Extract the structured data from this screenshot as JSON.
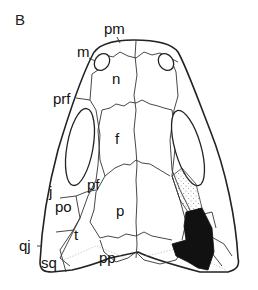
{
  "figure": {
    "panel_label": "B",
    "labels": {
      "pm": "pm",
      "m": "m",
      "n": "n",
      "prf": "prf",
      "f": "f",
      "pf": "pf",
      "j": "j",
      "po": "po",
      "p": "p",
      "qj": "qj",
      "t": "t",
      "sq": "sq",
      "pp": "pp"
    },
    "colors": {
      "line": "#222222",
      "shaded_region": "#111111",
      "stippled_region": "#bbbbbb",
      "background": "#ffffff"
    }
  }
}
